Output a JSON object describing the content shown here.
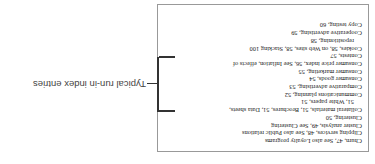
{
  "annotation": {
    "label": "Typical run-in index entries"
  },
  "entries": [
    {
      "text": "Churn, 47, See also Loyalty programs",
      "indent": false
    },
    {
      "text": "Clipping services, 48, See also Public relations",
      "indent": false
    },
    {
      "text": "Cluster analysis, 49, See Clustering",
      "indent": false
    },
    {
      "text": "Clustering, 50",
      "indent": false
    },
    {
      "text": "Collateral materials, 51, Brochures, 51, Data sheets,",
      "indent": false
    },
    {
      "text": "51, White papers, 51",
      "indent": true
    },
    {
      "text": "Communications planning, 52",
      "indent": false
    },
    {
      "text": "Comparative advertising, 53",
      "indent": false
    },
    {
      "text": "Consumer goods, 54",
      "indent": false
    },
    {
      "text": "Consumer marketing, 55",
      "indent": false
    },
    {
      "text": "Consumer price index, 56, See Inflation, effects of",
      "indent": false
    },
    {
      "text": "Contests, 57",
      "indent": false
    },
    {
      "text": "Cookies, 58, on Web sites, 58, Stacking 100",
      "indent": false
    },
    {
      "text": "repositioning, 58",
      "indent": true
    },
    {
      "text": "Cooperative advertising, 59",
      "indent": false
    },
    {
      "text": "Copy testing, 60",
      "indent": false
    }
  ]
}
